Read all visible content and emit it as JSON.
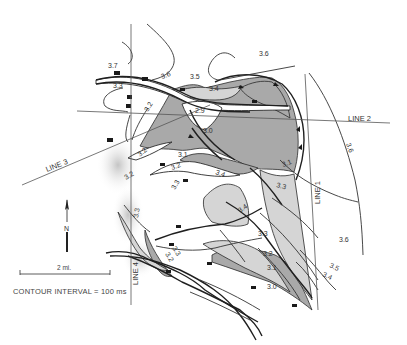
{
  "map": {
    "title": "Seismic time-structure contour map",
    "colors": {
      "background": "#ffffff",
      "dark_shade": "#a8a8a8",
      "light_shade": "#d4d4d4",
      "line": "#2a2a2a",
      "text": "#333333"
    },
    "survey_lines": [
      {
        "id": "line-1",
        "label": "LINE 1"
      },
      {
        "id": "line-2",
        "label": "LINE 2"
      },
      {
        "id": "line-3",
        "label": "LINE 3"
      },
      {
        "id": "line-4",
        "label": "LINE 4"
      }
    ],
    "contour_labels": [
      "3.7",
      "3.6",
      "3.3",
      "3.2",
      "3.5",
      "3.4",
      "2.9",
      "3.0",
      "3.6",
      "3.6",
      "3.2",
      "3.2",
      "3.4",
      "3.3",
      "3.1",
      "3.3",
      "3.4",
      "3.3",
      "3.2",
      "3.3",
      "3.2",
      "3.1",
      "3.0",
      "3.6",
      "3.5",
      "3.4",
      "3.3",
      "3.2",
      "3.1"
    ],
    "north_arrow": {
      "label": "N"
    },
    "scale_bar": {
      "label": "2 mi."
    },
    "legend": {
      "contour_interval": "CONTOUR INTERVAL = 100 ms"
    }
  }
}
